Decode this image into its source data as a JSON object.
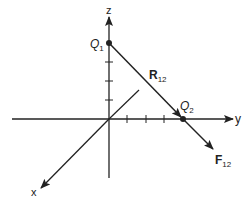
{
  "diagram": {
    "type": "3d-coordinate-vector-diagram",
    "colors": {
      "stroke": "#222222",
      "background": "#ffffff"
    },
    "axes": {
      "x": {
        "label": "x"
      },
      "y": {
        "label": "y"
      },
      "z": {
        "label": "z"
      }
    },
    "points": {
      "q1": {
        "label": "Q",
        "sub": "1"
      },
      "q2": {
        "label": "Q",
        "sub": "2"
      }
    },
    "vectors": {
      "r12": {
        "label": "R",
        "sub": "12"
      },
      "f12": {
        "label": "F",
        "sub": "12"
      }
    },
    "ticks": {
      "z_count": 3,
      "y_count": 3
    }
  }
}
